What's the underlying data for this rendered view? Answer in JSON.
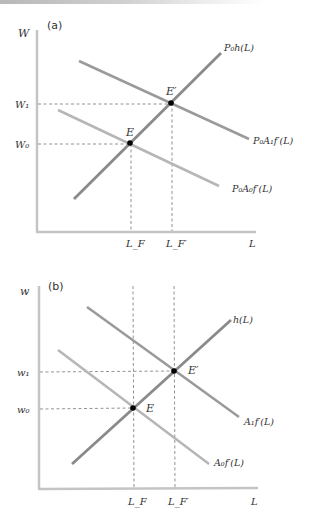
{
  "colors": {
    "axis": "#c4c4c4",
    "supply": "#8a8a8a",
    "demand_new": "#9a9a9a",
    "demand_old": "#b6b6b6",
    "dashed": "#777777",
    "point": "#000000",
    "text": "#333333"
  },
  "panel_a": {
    "panel_label": "(a)",
    "y_axis_label": "W",
    "x_axis_label": "L",
    "y_ticks": {
      "w1": "W₁",
      "w0": "W₀"
    },
    "x_ticks": {
      "lf": "L_F",
      "lf_prime": "L_F′"
    },
    "curves": {
      "supply": "P₀h(L)",
      "demand_new": "P₀A₁f′(L)",
      "demand_old": "P₀A₀f′(L)"
    },
    "points": {
      "e": "E",
      "e_prime": "E′"
    }
  },
  "panel_b": {
    "panel_label": "(b)",
    "y_axis_label": "w",
    "x_axis_label": "L",
    "y_ticks": {
      "w1": "w₁",
      "w0": "w₀"
    },
    "x_ticks": {
      "lf": "L_F",
      "lf_prime": "L_F′"
    },
    "curves": {
      "supply": "h(L)",
      "demand_new": "A₁f′(L)",
      "demand_old": "A₀f′(L)"
    },
    "points": {
      "e": "E",
      "e_prime": "E′"
    }
  }
}
